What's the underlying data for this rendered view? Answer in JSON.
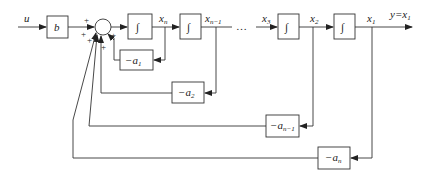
{
  "diagram": {
    "type": "block-diagram",
    "input": {
      "label": "u"
    },
    "gain": {
      "label": "b"
    },
    "sum_signs": [
      "+",
      "+",
      "+",
      "+",
      "+"
    ],
    "integrators": [
      {
        "id": "int-1",
        "glyph": "∫",
        "output_label": "x",
        "output_sub": "n"
      },
      {
        "id": "int-2",
        "glyph": "∫",
        "output_label": "x",
        "output_sub": "n−1"
      },
      {
        "id": "int-3",
        "glyph": "∫",
        "output_label": "x",
        "output_sub": "2",
        "input_label": "x",
        "input_sub": "3"
      },
      {
        "id": "int-4",
        "glyph": "∫",
        "output_label": "x",
        "output_sub": "1"
      }
    ],
    "ellipsis": "…",
    "output": {
      "label": "y=x",
      "sub": "1"
    },
    "feedback": [
      {
        "label": "−a",
        "sub": "1"
      },
      {
        "label": "−a",
        "sub": "2"
      },
      {
        "label": "−a",
        "sub": "n−1"
      },
      {
        "label": "−a",
        "sub": "n"
      }
    ]
  }
}
